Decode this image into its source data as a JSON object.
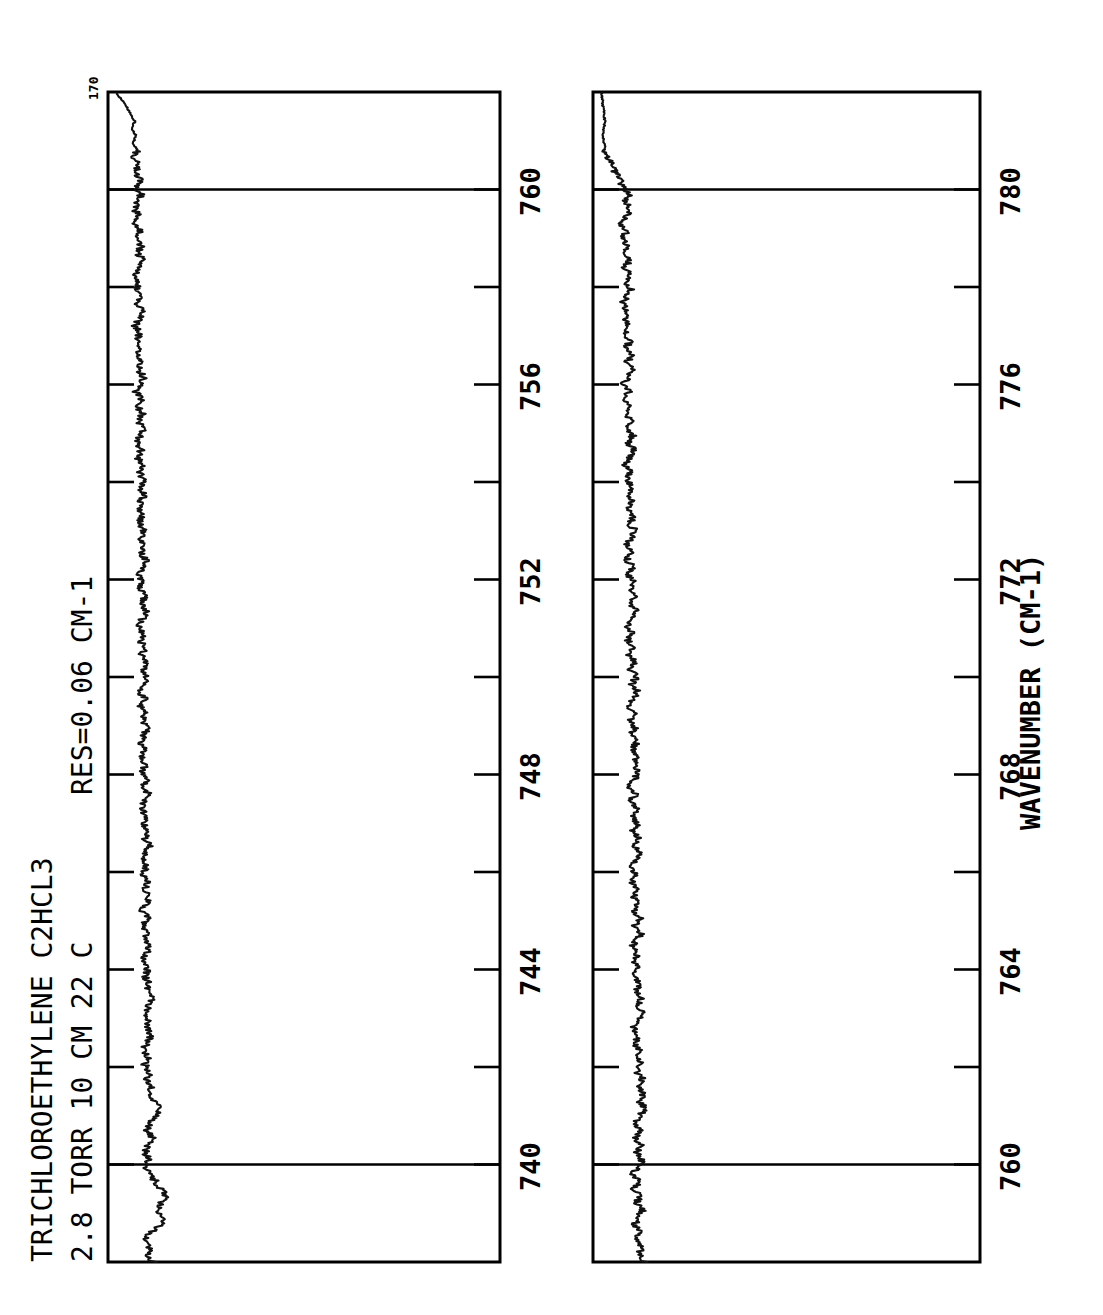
{
  "figure": {
    "background_color": "#ffffff",
    "ink_color": "#000000",
    "orientation": "rotated-90-ccw",
    "corner_label": "170"
  },
  "title": {
    "line1": "TRICHLOROETHYLENE  C2HCL3",
    "line2": "2.8 TORR  10 CM  22 C",
    "resolution": "RES=0.06 CM-1"
  },
  "axis": {
    "xlabel": "WAVENUMBER (CM-1)"
  },
  "chart_data": {
    "type": "line",
    "title": "TRICHLOROETHYLENE  C2HCL3",
    "subtitle": "2.8 TORR  10 CM  22 C",
    "annotations": [
      "RES=0.06 CM-1",
      "170"
    ],
    "xlabel": "WAVENUMBER (CM-1)",
    "ylabel": "",
    "grid": false,
    "legend": "none",
    "orientation": "horizontal-spectrum-rotated",
    "panels": [
      {
        "name": "panel-top",
        "xlim": [
          738.0,
          762.0
        ],
        "ylim": [
          0.0,
          1.0
        ],
        "major_ticks": [
          740,
          744,
          748,
          752,
          756,
          760
        ],
        "minor_ticks": [
          742,
          746,
          750,
          754,
          758
        ],
        "gridlines": [
          740,
          760
        ],
        "tick_labels": [
          "740",
          "744",
          "748",
          "752",
          "756",
          "760"
        ],
        "baseline": 0.86,
        "series": [
          {
            "name": "transmittance",
            "x": [
              738.0,
              738.15,
              738.3,
              738.45,
              738.6,
              738.75,
              738.9,
              739.05,
              739.2,
              739.35,
              739.5,
              739.65,
              739.8,
              739.95,
              740.1,
              740.25,
              740.4,
              740.55,
              740.7,
              740.85,
              741.0,
              741.15,
              741.3,
              741.45,
              741.6,
              741.75,
              741.9,
              742.05,
              742.2,
              742.35,
              742.5,
              742.65,
              742.8,
              742.95,
              743.1,
              743.25,
              743.4,
              743.55,
              743.7,
              743.85,
              744.0,
              744.15,
              744.3,
              744.45,
              744.6,
              744.75,
              744.9,
              745.05,
              745.2,
              745.35,
              745.5,
              745.65,
              745.8,
              745.95,
              746.1,
              746.25,
              746.4,
              746.55,
              746.7,
              746.85,
              747.0,
              747.15,
              747.3,
              747.45,
              747.6,
              747.75,
              747.9,
              748.05,
              748.2,
              748.35,
              748.5,
              748.65,
              748.8,
              748.95,
              749.1,
              749.25,
              749.4,
              749.55,
              749.7,
              749.85,
              750.0,
              750.15,
              750.3,
              750.45,
              750.6,
              750.75,
              750.9,
              751.05,
              751.2,
              751.35,
              751.5,
              751.65,
              751.8,
              751.95,
              752.1,
              752.25,
              752.4,
              752.55,
              752.7,
              752.85,
              753.0,
              753.15,
              753.3,
              753.45,
              753.6,
              753.75,
              753.9,
              754.05,
              754.2,
              754.35,
              754.5,
              754.65,
              754.8,
              754.95,
              755.1,
              755.25,
              755.4,
              755.55,
              755.7,
              755.85,
              756.0,
              756.15,
              756.3,
              756.45,
              756.6,
              756.75,
              756.9,
              757.05,
              757.2,
              757.35,
              757.5,
              757.65,
              757.8,
              757.95,
              758.1,
              758.25,
              758.4,
              758.55,
              758.7,
              758.85,
              759.0,
              759.15,
              759.3,
              759.45,
              759.6,
              759.75,
              759.9,
              760.05,
              760.2,
              760.35,
              760.5,
              760.65,
              760.8,
              760.95,
              761.1,
              761.25,
              761.4,
              761.55,
              761.7,
              761.85,
              762.0
            ],
            "y": [
              0.83,
              0.855,
              0.845,
              0.87,
              0.84,
              0.8,
              0.79,
              0.815,
              0.8,
              0.775,
              0.8,
              0.82,
              0.845,
              0.86,
              0.845,
              0.865,
              0.85,
              0.835,
              0.855,
              0.845,
              0.82,
              0.805,
              0.825,
              0.845,
              0.835,
              0.855,
              0.845,
              0.865,
              0.85,
              0.87,
              0.855,
              0.84,
              0.855,
              0.845,
              0.865,
              0.85,
              0.835,
              0.855,
              0.845,
              0.865,
              0.855,
              0.875,
              0.86,
              0.845,
              0.865,
              0.85,
              0.87,
              0.855,
              0.875,
              0.86,
              0.845,
              0.865,
              0.85,
              0.87,
              0.86,
              0.875,
              0.86,
              0.845,
              0.865,
              0.855,
              0.875,
              0.86,
              0.88,
              0.865,
              0.85,
              0.87,
              0.855,
              0.875,
              0.86,
              0.88,
              0.865,
              0.885,
              0.87,
              0.855,
              0.875,
              0.86,
              0.88,
              0.865,
              0.885,
              0.87,
              0.855,
              0.875,
              0.86,
              0.88,
              0.865,
              0.885,
              0.87,
              0.89,
              0.875,
              0.86,
              0.88,
              0.865,
              0.885,
              0.87,
              0.89,
              0.875,
              0.86,
              0.88,
              0.865,
              0.885,
              0.87,
              0.89,
              0.875,
              0.895,
              0.88,
              0.865,
              0.885,
              0.87,
              0.89,
              0.875,
              0.895,
              0.88,
              0.9,
              0.885,
              0.87,
              0.89,
              0.875,
              0.895,
              0.88,
              0.9,
              0.885,
              0.87,
              0.89,
              0.875,
              0.895,
              0.88,
              0.9,
              0.885,
              0.905,
              0.89,
              0.875,
              0.895,
              0.88,
              0.9,
              0.885,
              0.905,
              0.89,
              0.875,
              0.895,
              0.88,
              0.9,
              0.885,
              0.905,
              0.89,
              0.91,
              0.895,
              0.88,
              0.9,
              0.885,
              0.905,
              0.89,
              0.91,
              0.895,
              0.915,
              0.9,
              0.92,
              0.905,
              0.925,
              0.94,
              0.96,
              0.985
            ]
          }
        ]
      },
      {
        "name": "panel-bottom",
        "xlim": [
          758.0,
          782.0
        ],
        "ylim": [
          0.0,
          1.0
        ],
        "major_ticks": [
          760,
          764,
          768,
          772,
          776,
          780
        ],
        "minor_ticks": [
          762,
          766,
          770,
          774,
          778
        ],
        "gridlines": [
          760,
          780
        ],
        "tick_labels": [
          "760",
          "764",
          "768",
          "772",
          "776",
          "780"
        ],
        "baseline": 0.8,
        "series": [
          {
            "name": "transmittance",
            "x": [
              758.0,
              758.15,
              758.3,
              758.45,
              758.6,
              758.75,
              758.9,
              759.05,
              759.2,
              759.35,
              759.5,
              759.65,
              759.8,
              759.95,
              760.1,
              760.25,
              760.4,
              760.55,
              760.7,
              760.85,
              761.0,
              761.15,
              761.3,
              761.45,
              761.6,
              761.75,
              761.9,
              762.05,
              762.2,
              762.35,
              762.5,
              762.65,
              762.8,
              762.95,
              763.1,
              763.25,
              763.4,
              763.55,
              763.7,
              763.85,
              764.0,
              764.15,
              764.3,
              764.45,
              764.6,
              764.75,
              764.9,
              765.05,
              765.2,
              765.35,
              765.5,
              765.65,
              765.8,
              765.95,
              766.1,
              766.25,
              766.4,
              766.55,
              766.7,
              766.85,
              767.0,
              767.15,
              767.3,
              767.45,
              767.6,
              767.75,
              767.9,
              768.05,
              768.2,
              768.35,
              768.5,
              768.65,
              768.8,
              768.95,
              769.1,
              769.25,
              769.4,
              769.55,
              769.7,
              769.85,
              770.0,
              770.15,
              770.3,
              770.45,
              770.6,
              770.75,
              770.9,
              771.05,
              771.2,
              771.35,
              771.5,
              771.65,
              771.8,
              771.95,
              772.1,
              772.25,
              772.4,
              772.55,
              772.7,
              772.85,
              773.0,
              773.15,
              773.3,
              773.45,
              773.6,
              773.75,
              773.9,
              774.05,
              774.2,
              774.35,
              774.5,
              774.65,
              774.8,
              774.95,
              775.1,
              775.25,
              775.4,
              775.55,
              775.7,
              775.85,
              776.0,
              776.15,
              776.3,
              776.45,
              776.6,
              776.75,
              776.9,
              777.05,
              777.2,
              777.35,
              777.5,
              777.65,
              777.8,
              777.95,
              778.1,
              778.25,
              778.4,
              778.55,
              778.7,
              778.85,
              779.0,
              779.15,
              779.3,
              779.45,
              779.6,
              779.75,
              779.9,
              780.05,
              780.2,
              780.35,
              780.5,
              780.65,
              780.8,
              780.95,
              781.1,
              781.25,
              781.4,
              781.55,
              781.7,
              781.85,
              782.0
            ],
            "y": [
              0.8,
              0.825,
              0.81,
              0.835,
              0.82,
              0.845,
              0.83,
              0.81,
              0.835,
              0.82,
              0.845,
              0.825,
              0.85,
              0.83,
              0.81,
              0.835,
              0.815,
              0.84,
              0.82,
              0.845,
              0.825,
              0.8,
              0.825,
              0.805,
              0.83,
              0.81,
              0.835,
              0.815,
              0.84,
              0.82,
              0.845,
              0.825,
              0.85,
              0.83,
              0.81,
              0.835,
              0.815,
              0.84,
              0.82,
              0.845,
              0.825,
              0.85,
              0.83,
              0.855,
              0.835,
              0.815,
              0.84,
              0.82,
              0.845,
              0.825,
              0.85,
              0.83,
              0.855,
              0.835,
              0.86,
              0.84,
              0.82,
              0.845,
              0.825,
              0.85,
              0.83,
              0.855,
              0.835,
              0.86,
              0.84,
              0.865,
              0.845,
              0.825,
              0.85,
              0.83,
              0.855,
              0.835,
              0.86,
              0.84,
              0.865,
              0.845,
              0.87,
              0.85,
              0.83,
              0.855,
              0.835,
              0.86,
              0.84,
              0.865,
              0.845,
              0.87,
              0.85,
              0.875,
              0.855,
              0.835,
              0.86,
              0.84,
              0.865,
              0.845,
              0.87,
              0.85,
              0.875,
              0.855,
              0.88,
              0.86,
              0.84,
              0.865,
              0.845,
              0.87,
              0.85,
              0.875,
              0.855,
              0.88,
              0.86,
              0.885,
              0.865,
              0.845,
              0.87,
              0.85,
              0.875,
              0.855,
              0.88,
              0.86,
              0.885,
              0.865,
              0.89,
              0.87,
              0.85,
              0.875,
              0.855,
              0.88,
              0.86,
              0.885,
              0.865,
              0.89,
              0.87,
              0.895,
              0.875,
              0.855,
              0.88,
              0.86,
              0.885,
              0.865,
              0.89,
              0.87,
              0.895,
              0.875,
              0.9,
              0.88,
              0.86,
              0.885,
              0.865,
              0.89,
              0.905,
              0.925,
              0.94,
              0.955,
              0.965,
              0.97,
              0.975,
              0.972,
              0.968,
              0.97,
              0.975,
              0.978,
              0.982
            ]
          }
        ]
      }
    ]
  }
}
